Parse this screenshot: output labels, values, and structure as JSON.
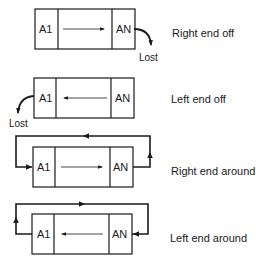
{
  "diagrams": [
    {
      "first_cell": "A1",
      "last_cell": "AN",
      "direction": "right",
      "caption": "Right end off",
      "lost_label": "Lost"
    },
    {
      "first_cell": "A1",
      "last_cell": "AN",
      "direction": "left",
      "caption": "Left end off",
      "lost_label": "Lost"
    },
    {
      "first_cell": "A1",
      "last_cell": "AN",
      "direction": "right",
      "caption": "Right end around"
    },
    {
      "first_cell": "A1",
      "last_cell": "AN",
      "direction": "left",
      "caption": "Left end around"
    }
  ],
  "colors": {
    "stroke": "#1a1a1a",
    "background": "#ffffff"
  }
}
